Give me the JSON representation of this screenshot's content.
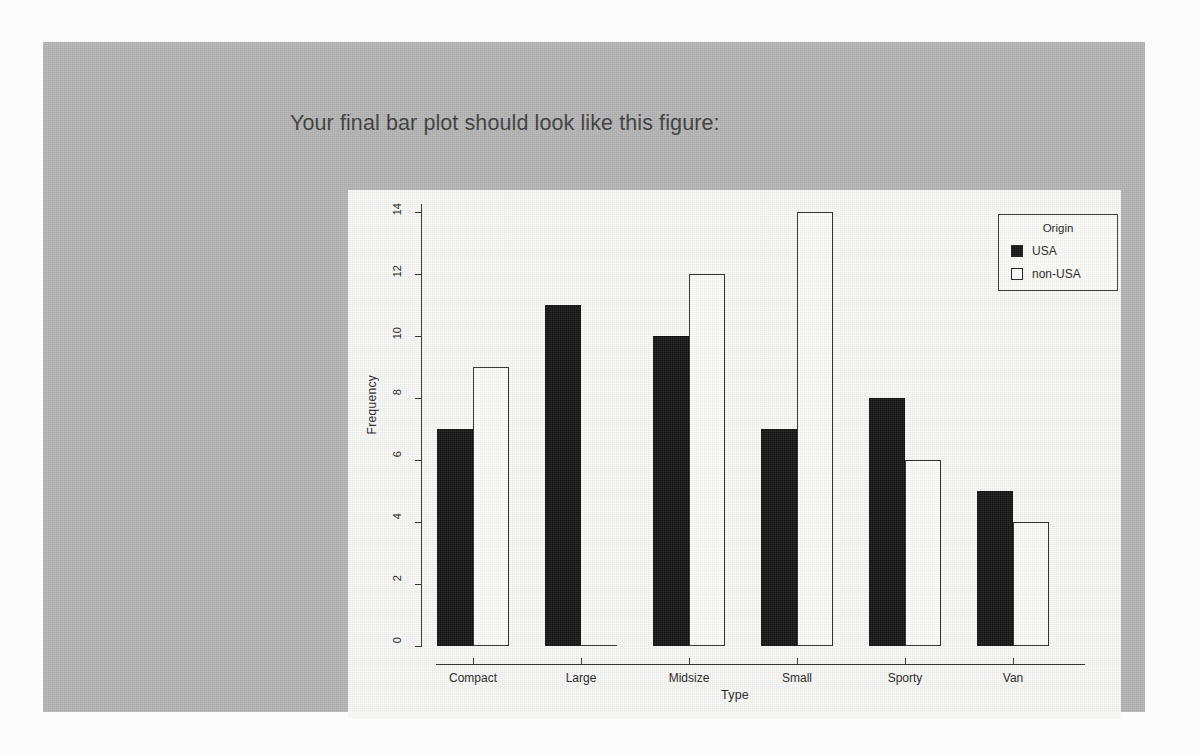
{
  "page": {
    "background_color": "#fbfbfb",
    "panel_color": "#b2b2b2",
    "card_color": "#f7f7f5"
  },
  "heading": {
    "text": "Your final bar plot should look like this figure:"
  },
  "chart_data": {
    "type": "bar",
    "title": "",
    "xlabel": "Type",
    "ylabel": "Frequency",
    "categories": [
      "Compact",
      "Large",
      "Midsize",
      "Small",
      "Sporty",
      "Van"
    ],
    "series": [
      {
        "name": "USA",
        "values": [
          7,
          11,
          10,
          7,
          8,
          5
        ],
        "color": "#131313",
        "fill": "solid"
      },
      {
        "name": "non-USA",
        "values": [
          9,
          0,
          12,
          14,
          6,
          4
        ],
        "color": "#ffffff",
        "fill": "hollow"
      }
    ],
    "ylim": [
      0,
      14
    ],
    "yticks": [
      0,
      2,
      4,
      6,
      8,
      10,
      12,
      14
    ],
    "grid": false,
    "legend": {
      "title": "Origin",
      "position": "top-right",
      "entries": [
        {
          "label": "USA",
          "swatch": "filled"
        },
        {
          "label": "non-USA",
          "swatch": "hollow"
        }
      ]
    },
    "beside": true,
    "axis_color": "#2f2f2f"
  }
}
